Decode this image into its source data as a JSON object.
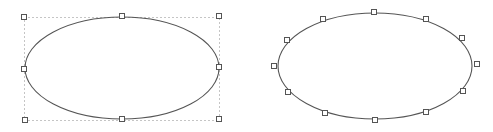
{
  "canvas": {
    "width": 493,
    "height": 132,
    "background": "#ffffff"
  },
  "colors": {
    "stroke": "#555555",
    "bbox": "#8a8a8a",
    "handle_stroke": "#555555",
    "handle_fill": "#ffffff"
  },
  "shapes": [
    {
      "id": "ellipse-selected-bbox",
      "type": "ellipse",
      "cx": 122,
      "cy": 68,
      "rx": 97,
      "ry": 51,
      "bounding_box": {
        "x": 24,
        "y": 17,
        "width": 195,
        "height": 103
      },
      "handles": [
        {
          "x": 24,
          "y": 17
        },
        {
          "x": 122,
          "y": 16
        },
        {
          "x": 219,
          "y": 16
        },
        {
          "x": 24,
          "y": 69
        },
        {
          "x": 219,
          "y": 67
        },
        {
          "x": 25,
          "y": 120
        },
        {
          "x": 122,
          "y": 119
        },
        {
          "x": 219,
          "y": 119
        }
      ]
    },
    {
      "id": "ellipse-point-edit",
      "type": "ellipse",
      "cx": 375,
      "cy": 66,
      "rx": 97,
      "ry": 53,
      "handles": [
        {
          "x": 374,
          "y": 12
        },
        {
          "x": 323,
          "y": 19
        },
        {
          "x": 426,
          "y": 19
        },
        {
          "x": 287,
          "y": 40
        },
        {
          "x": 462,
          "y": 38
        },
        {
          "x": 274,
          "y": 66
        },
        {
          "x": 477,
          "y": 64
        },
        {
          "x": 288,
          "y": 92
        },
        {
          "x": 463,
          "y": 91
        },
        {
          "x": 325,
          "y": 113
        },
        {
          "x": 426,
          "y": 112
        },
        {
          "x": 375,
          "y": 120
        }
      ]
    }
  ]
}
